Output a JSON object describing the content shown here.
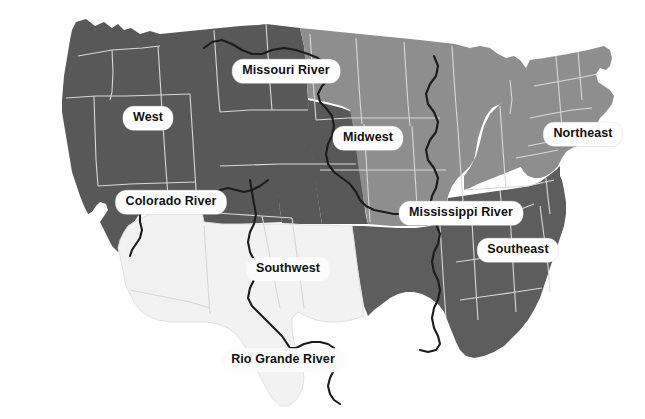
{
  "map": {
    "title": "United States Regions and Major Rivers",
    "background_color": "#ffffff",
    "border_color": "#d8d8d8",
    "river_color": "#1c1c1c",
    "regions": [
      {
        "key": "west",
        "label": "West",
        "fill": "#585858",
        "label_x": 148,
        "label_y": 118,
        "label_style": "pill"
      },
      {
        "key": "midwest",
        "label": "Midwest",
        "fill": "#8e8e8e",
        "label_x": 368,
        "label_y": 138,
        "label_style": "pill"
      },
      {
        "key": "northeast",
        "label": "Northeast",
        "fill": "#8e8e8e",
        "label_x": 583,
        "label_y": 134,
        "label_style": "pill"
      },
      {
        "key": "southeast",
        "label": "Southeast",
        "fill": "#5d5d5d",
        "label_x": 518,
        "label_y": 250,
        "label_style": "pill"
      },
      {
        "key": "southwest",
        "label": "Southwest",
        "fill": "#f2f2f2",
        "label_x": 288,
        "label_y": 269,
        "label_style": "plain"
      }
    ],
    "rivers": [
      {
        "key": "missouri",
        "label": "Missouri River",
        "label_x": 286,
        "label_y": 71,
        "label_style": "pill"
      },
      {
        "key": "colorado",
        "label": "Colorado River",
        "label_x": 171,
        "label_y": 202,
        "label_style": "pill"
      },
      {
        "key": "mississippi",
        "label": "Mississippi River",
        "label_x": 461,
        "label_y": 213,
        "label_style": "pill"
      },
      {
        "key": "rio-grande",
        "label": "Rio Grande River",
        "label_x": 283,
        "label_y": 360,
        "label_style": "plain"
      }
    ]
  }
}
